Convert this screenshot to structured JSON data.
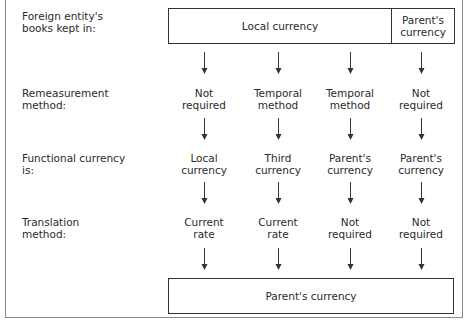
{
  "row_labels": [
    "Foreign entity's\nbooks kept in:",
    "Remeasurement\nmethod:",
    "Functional currency\nis:",
    "Translation\nmethod:"
  ],
  "top_box": {
    "left_label": "Local currency",
    "right_label": "Parent's\ncurrency"
  },
  "columns": [
    {
      "remeasurement": "Not\nrequired",
      "functional": "Local\ncurrency",
      "translation": "Current\nrate"
    },
    {
      "remeasurement": "Temporal\nmethod",
      "functional": "Third\ncurrency",
      "translation": "Current\nrate"
    },
    {
      "remeasurement": "Temporal\nmethod",
      "functional": "Parent's\ncurrency",
      "translation": "Not\nrequired"
    },
    {
      "remeasurement": "Not\nrequired",
      "functional": "Parent's\ncurrency",
      "translation": "Not\nrequired"
    }
  ],
  "bottom_box": {
    "label": "Parent's currency"
  },
  "colors": {
    "line": "#333333",
    "frame": "#8a8a8a",
    "text": "#2a2a2a"
  }
}
